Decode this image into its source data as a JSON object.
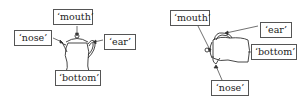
{
  "diagram": {
    "left_panel": {
      "orientation": "upright",
      "labels": {
        "mouth": "‘mouth’",
        "nose": "‘nose’",
        "ear": "‘ear’",
        "bottom": "‘bottom’"
      }
    },
    "right_panel": {
      "orientation": "rotated",
      "labels": {
        "mouth": "‘mouth’",
        "ear": "‘ear’",
        "bottom": "‘bottom’",
        "nose": "‘nose’"
      }
    },
    "colors": {
      "stroke": "#333333",
      "box_border": "#555555",
      "background": "#ffffff"
    }
  }
}
